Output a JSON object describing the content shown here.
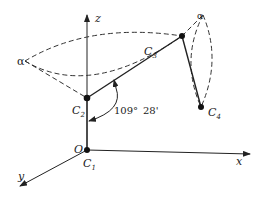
{
  "diagram": {
    "type": "molecular-geometry",
    "axes": {
      "x": {
        "label": "x"
      },
      "y": {
        "label": "y"
      },
      "z": {
        "label": "z"
      },
      "origin": {
        "label": "O"
      }
    },
    "atoms": [
      {
        "id": "C1",
        "label": "C",
        "sub": "1"
      },
      {
        "id": "C2",
        "label": "C",
        "sub": "2"
      },
      {
        "id": "C3",
        "label": "C",
        "sub": "3"
      },
      {
        "id": "C4",
        "label": "C",
        "sub": "4"
      }
    ],
    "planes": [
      {
        "id": "alpha-left",
        "label": "α"
      },
      {
        "id": "alpha-right",
        "label": "α"
      }
    ],
    "angle": {
      "value": "109°",
      "minutes": "28'"
    }
  }
}
